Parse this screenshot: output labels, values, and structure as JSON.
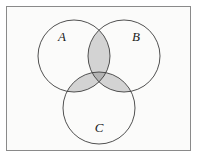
{
  "figure": {
    "kind": "venn-diagram",
    "background_color": "#fbfbfa",
    "page_color": "#ffffff",
    "frame": {
      "border_color": "#8a8a8a",
      "x": 6,
      "y": 6,
      "width": 185,
      "height": 145
    },
    "stroke_color": "#3d3d3d",
    "stroke_width": 0.9,
    "fill_light": "#d3d3d3",
    "fill_dark": "#b4b4b4",
    "circle_fill": "#fbfbfa"
  },
  "sets": [
    {
      "id": "A",
      "label": "A",
      "cx": 74,
      "cy": 56,
      "r": 36,
      "label_x": 62,
      "label_y": 41
    },
    {
      "id": "B",
      "label": "B",
      "cx": 124,
      "cy": 56,
      "r": 36,
      "label_x": 136,
      "label_y": 41
    },
    {
      "id": "C",
      "label": "C",
      "cx": 99,
      "cy": 108,
      "r": 36,
      "label_x": 99,
      "label_y": 132
    }
  ],
  "shaded_regions": [
    {
      "name": "A-intersect-B",
      "shade": "light"
    },
    {
      "name": "A-intersect-C",
      "shade": "light"
    },
    {
      "name": "B-intersect-C",
      "shade": "light"
    },
    {
      "name": "A-intersect-B-intersect-C",
      "shade": "dark"
    }
  ]
}
